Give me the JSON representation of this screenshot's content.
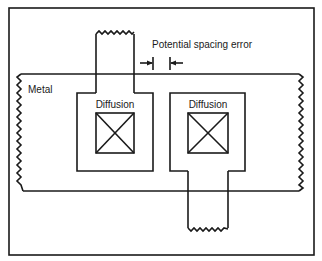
{
  "diagram": {
    "labels": {
      "metal": "Metal",
      "diffusion_left": "Diffusion",
      "diffusion_right": "Diffusion",
      "spacing_error": "Potential spacing error"
    },
    "colors": {
      "line": "#1a1a1a",
      "background": "#ffffff"
    },
    "elements": [
      {
        "name": "outer-frame",
        "type": "rectangle"
      },
      {
        "name": "metal-layer",
        "type": "region with broken (zigzag) left and right edges"
      },
      {
        "name": "left-diffusion",
        "type": "region with contact and upward stub"
      },
      {
        "name": "right-diffusion",
        "type": "region with contact and downward stub"
      },
      {
        "name": "spacing-error-dimension",
        "type": "dimension arrows between diffusions"
      }
    ]
  }
}
